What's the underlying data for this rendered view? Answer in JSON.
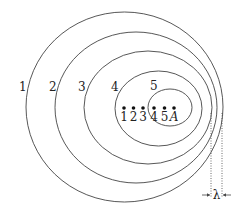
{
  "diagram": {
    "type": "doppler-wavefronts",
    "wavefronts": [
      {
        "label": "1",
        "cx": 124.5,
        "cy": 107,
        "rx": 98.5,
        "ry": 95
      },
      {
        "label": "2",
        "cx": 136,
        "cy": 107.5,
        "rx": 81,
        "ry": 75.5
      },
      {
        "label": "3",
        "cx": 148,
        "cy": 107.5,
        "rx": 64,
        "ry": 56.5
      },
      {
        "label": "4",
        "cx": 158.5,
        "cy": 108.5,
        "rx": 43.5,
        "ry": 37.5
      },
      {
        "label": "5",
        "cx": 170,
        "cy": 107.5,
        "rx": 22,
        "ry": 18.5
      }
    ],
    "wavefront_labels": [
      {
        "text": "1",
        "x": 19,
        "y": 91
      },
      {
        "text": "2",
        "x": 49,
        "y": 91
      },
      {
        "text": "3",
        "x": 78,
        "y": 91
      },
      {
        "text": "4",
        "x": 111,
        "y": 91
      },
      {
        "text": "5",
        "x": 150,
        "y": 90
      }
    ],
    "source_positions": [
      {
        "label": "1",
        "x": 124
      },
      {
        "label": "2",
        "x": 133.5
      },
      {
        "label": "3",
        "x": 143
      },
      {
        "label": "4",
        "x": 154
      },
      {
        "label": "5",
        "x": 164.5
      },
      {
        "label": "A",
        "x": 174
      }
    ],
    "wavelength_label": "λ",
    "wavelength_markers": {
      "x1": 211,
      "x2": 222,
      "y_top": 113,
      "y_bottom": 198,
      "arrow_y": 195
    }
  }
}
